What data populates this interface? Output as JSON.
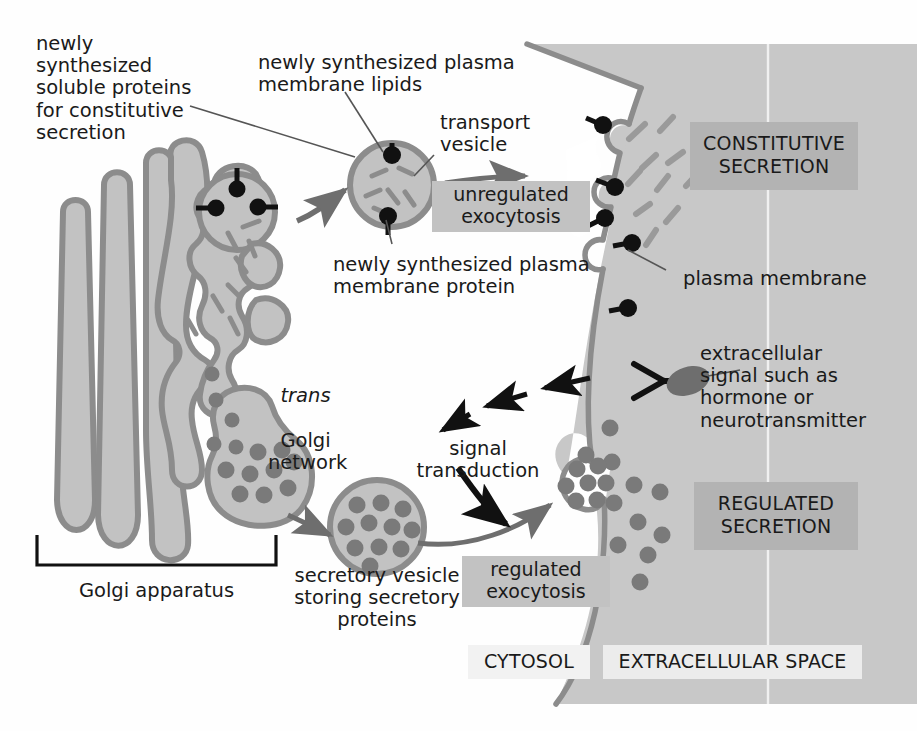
{
  "figure": {
    "background_color": "#ffffff",
    "cytosol_color": "#ffffff",
    "extracellular_color": "#c8c8c8",
    "membrane_color": "#8c8c8c",
    "organelle_fill": "#c2c2c2",
    "organelle_stroke": "#8c8c8c",
    "cargo_dot_color": "#7a7a7a",
    "protein_color": "#111111",
    "lipid_dash_color": "#8c8c8c"
  },
  "labels": {
    "soluble_proteins": "newly\nsynthesized\nsoluble proteins\nfor constitutive\nsecretion",
    "membrane_lipids": "newly synthesized plasma\nmembrane lipids",
    "transport_vesicle": "transport\nvesicle",
    "membrane_protein": "newly synthesized plasma\nmembrane protein",
    "plasma_membrane": "plasma membrane",
    "trans_golgi_italic": "trans",
    "trans_golgi_rest": "Golgi\nnetwork",
    "golgi_apparatus": "Golgi apparatus",
    "secretory_vesicle": "secretory vesicle\nstoring secretory\nproteins",
    "signal_transduction": "signal\ntransduction",
    "extracellular_signal": "extracellular\nsignal such as\nhormone or\nneurotransmitter"
  },
  "boxed_labels": {
    "unregulated_exocytosis": "unregulated\nexocytosis",
    "regulated_exocytosis": "regulated\nexocytosis",
    "constitutive_secretion": "CONSTITUTIVE\nSECRETION",
    "regulated_secretion": "REGULATED\nSECRETION",
    "cytosol": "CYTOSOL",
    "extracellular_space": "EXTRACELLULAR SPACE"
  },
  "icons": {
    "membrane_protein": "membrane-protein-pin-icon",
    "lipid": "lipid-dash-icon",
    "cargo": "secretory-protein-dot-icon",
    "receptor": "cell-surface-receptor-icon",
    "ligand": "signal-ligand-icon",
    "arrow": "flow-arrow-icon",
    "dashed_arrow": "signal-dashed-arrow-icon",
    "bracket": "golgi-bracket-icon"
  }
}
